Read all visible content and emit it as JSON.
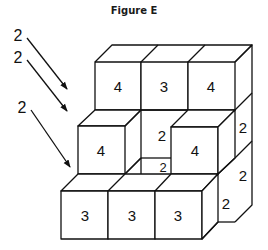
{
  "figure": {
    "title": "Figure E",
    "top_row": [
      {
        "label": "4"
      },
      {
        "label": "3"
      },
      {
        "label": "4"
      }
    ],
    "middle_row": {
      "left_cube": "4",
      "recess_back_wall": "2",
      "recess_floor": "2",
      "right_cube": "4",
      "right_side_top": "2"
    },
    "bottom_row": [
      {
        "label": "3"
      },
      {
        "label": "3"
      },
      {
        "label": "3"
      }
    ],
    "right_side_faces": [
      "2",
      "2"
    ],
    "arrows": [
      {
        "label": "2"
      },
      {
        "label": "2"
      },
      {
        "label": "2"
      }
    ]
  }
}
